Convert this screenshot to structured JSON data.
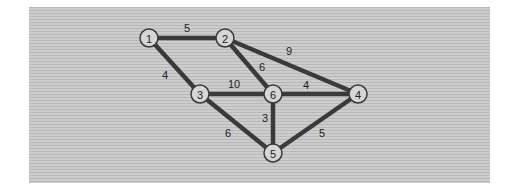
{
  "graph": {
    "type": "weighted-undirected-graph",
    "nodes": [
      {
        "id": "1",
        "label": "1",
        "x": 149,
        "y": 38
      },
      {
        "id": "2",
        "label": "2",
        "x": 225,
        "y": 38
      },
      {
        "id": "3",
        "label": "3",
        "x": 200,
        "y": 94
      },
      {
        "id": "6",
        "label": "6",
        "x": 273,
        "y": 94
      },
      {
        "id": "4",
        "label": "4",
        "x": 358,
        "y": 94
      },
      {
        "id": "5",
        "label": "5",
        "x": 273,
        "y": 153
      }
    ],
    "edges": [
      {
        "from": "1",
        "to": "2",
        "weight": "5",
        "lx": 187,
        "ly": 28
      },
      {
        "from": "1",
        "to": "3",
        "weight": "4",
        "lx": 165,
        "ly": 75
      },
      {
        "from": "2",
        "to": "4",
        "weight": "9",
        "lx": 289,
        "ly": 51
      },
      {
        "from": "2",
        "to": "6",
        "weight": "6",
        "lx": 262,
        "ly": 67
      },
      {
        "from": "3",
        "to": "6",
        "weight": "10",
        "lx": 234,
        "ly": 84
      },
      {
        "from": "6",
        "to": "4",
        "weight": "4",
        "lx": 306,
        "ly": 85
      },
      {
        "from": "3",
        "to": "5",
        "weight": "6",
        "lx": 228,
        "ly": 133
      },
      {
        "from": "6",
        "to": "5",
        "weight": "3",
        "lx": 265,
        "ly": 118
      },
      {
        "from": "4",
        "to": "5",
        "weight": "5",
        "lx": 322,
        "ly": 133
      }
    ]
  },
  "colors": {
    "edge": "#3a3a3a",
    "node_fill": "#d6d6d6",
    "background": "#c4c4c4"
  }
}
